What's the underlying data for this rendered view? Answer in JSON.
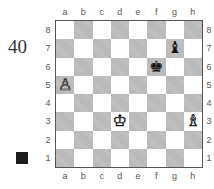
{
  "puzzle": {
    "number": "40",
    "side_to_move": "black",
    "side_to_move_color": "#1c1c1c"
  },
  "board": {
    "files": [
      "a",
      "b",
      "c",
      "d",
      "e",
      "f",
      "g",
      "h"
    ],
    "ranks": [
      "8",
      "7",
      "6",
      "5",
      "4",
      "3",
      "2",
      "1"
    ],
    "light_color": "#ffffff",
    "dark_color": "#c4c4c4",
    "pieces": [
      {
        "square": "g7",
        "color": "black",
        "type": "bishop",
        "glyph": "♝"
      },
      {
        "square": "f6",
        "color": "black",
        "type": "king",
        "glyph": "♚"
      },
      {
        "square": "a5",
        "color": "white",
        "type": "pawn",
        "glyph": "♙"
      },
      {
        "square": "d3",
        "color": "white",
        "type": "king",
        "glyph": "♔"
      },
      {
        "square": "h3",
        "color": "white",
        "type": "bishop",
        "glyph": "♗"
      }
    ]
  }
}
